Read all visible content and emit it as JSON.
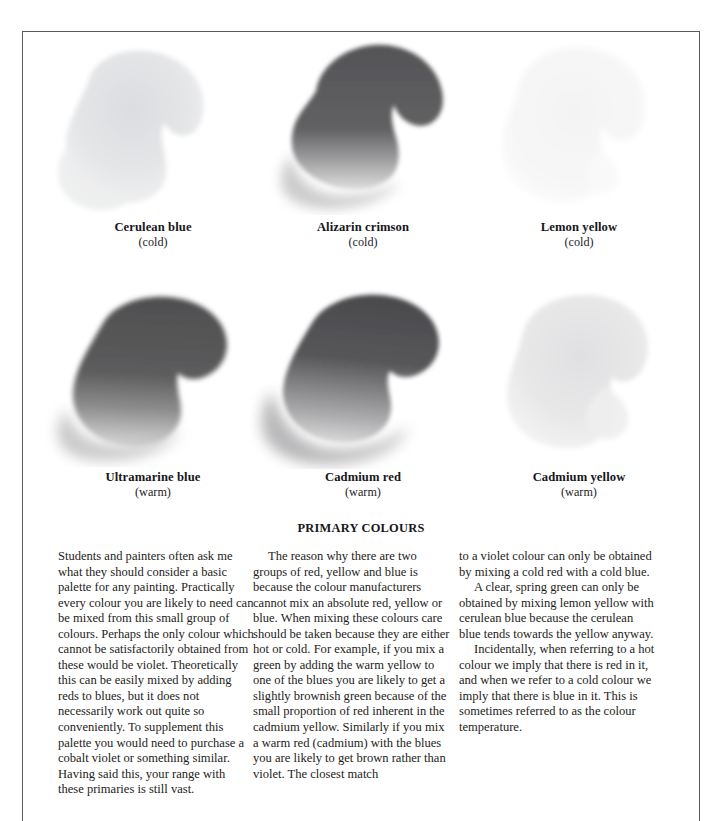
{
  "page": {
    "heading": "PRIMARY COLOURS"
  },
  "swatches": [
    {
      "name": "Cerulean blue",
      "temperature": "(cold)",
      "position": "top-left",
      "swatch_tone": "#e2e3e5",
      "swatch_tone_light": "#f2f2f3"
    },
    {
      "name": "Alizarin crimson",
      "temperature": "(cold)",
      "position": "top-centre",
      "swatch_tone": "#5e5e60",
      "swatch_tone_light": "#c8c8c9"
    },
    {
      "name": "Lemon yellow",
      "temperature": "(cold)",
      "position": "top-right",
      "swatch_tone": "#f6f6f6",
      "swatch_tone_light": "#fbfbfb"
    },
    {
      "name": "Ultramarine blue",
      "temperature": "(warm)",
      "position": "bottom-left",
      "swatch_tone": "#585859",
      "swatch_tone_light": "#c4c4c5"
    },
    {
      "name": "Cadmium red",
      "temperature": "(warm)",
      "position": "bottom-centre",
      "swatch_tone": "#5b5b5c",
      "swatch_tone_light": "#c0c0c1"
    },
    {
      "name": "Cadmium yellow",
      "temperature": "(warm)",
      "position": "bottom-right",
      "swatch_tone": "#e6e6e7",
      "swatch_tone_light": "#f4f4f4"
    }
  ],
  "columns": {
    "one": {
      "paragraphs": [
        "Students and painters often ask me what they should consider a basic palette for any painting. Practically every colour you are likely to need can be mixed from this small group of colours. Perhaps the only colour which cannot be satisfactorily obtained from these would be violet. Theoretically this can be easily mixed by adding reds to blues, but it does not necessarily work out quite so conveniently. To supplement this palette you would need to purchase a cobalt violet or something similar. Having said this, your range with these primaries is still vast."
      ]
    },
    "two": {
      "paragraphs": [
        "The reason why there are two groups of red, yellow and blue is because the colour manufacturers cannot mix an absolute red, yellow or blue. When mixing these colours care should be taken because they are either hot or cold. For example, if you mix a green by adding the warm yellow to one of the blues you are likely to get a slightly brownish green because of the small proportion of red inherent in the cadmium yellow. Similarly if you mix a warm red (cadmium) with the blues you are likely to get brown rather than violet. The closest match"
      ]
    },
    "three": {
      "paragraphs": [
        "to a violet colour can only be obtained by mixing a cold red with a cold blue.",
        "A clear, spring green can only be obtained by mixing lemon yellow with cerulean blue because the cerulean blue tends towards the yellow anyway.",
        "Incidentally, when referring to a hot colour we imply that there is red in it, and when we refer to a cold colour we imply that there is blue in it. This is sometimes referred to as the colour temperature."
      ]
    }
  }
}
